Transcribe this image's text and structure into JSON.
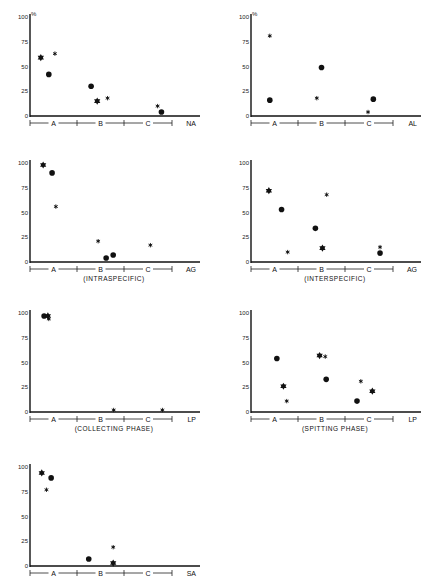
{
  "figure": {
    "y_unit_label": "%",
    "y_ticks": [
      "0",
      "25",
      "50",
      "75",
      "100"
    ],
    "x_groups": [
      "A",
      "B",
      "C"
    ],
    "marker_legend": {
      "star": "large six-pointed star",
      "asterisk": "small asterisk",
      "dot": "filled circle"
    }
  },
  "chart_data": [
    {
      "type": "scatter",
      "panel": "NA",
      "title": "",
      "caption": "",
      "ylabel": "%",
      "ylim": [
        0,
        100
      ],
      "categories": [
        "A",
        "B",
        "C"
      ],
      "show_pct": true,
      "points": [
        {
          "group": "A",
          "xpos": 0.23,
          "y": 59,
          "marker": "star"
        },
        {
          "group": "A",
          "xpos": 0.4,
          "y": 42,
          "marker": "dot"
        },
        {
          "group": "A",
          "xpos": 0.53,
          "y": 63,
          "marker": "asterisk"
        },
        {
          "group": "B",
          "xpos": 0.3,
          "y": 30,
          "marker": "dot"
        },
        {
          "group": "B",
          "xpos": 0.43,
          "y": 15,
          "marker": "star"
        },
        {
          "group": "B",
          "xpos": 0.65,
          "y": 18,
          "marker": "asterisk"
        },
        {
          "group": "C",
          "xpos": 0.7,
          "y": 10,
          "marker": "asterisk"
        },
        {
          "group": "C",
          "xpos": 0.78,
          "y": 4,
          "marker": "dot"
        }
      ]
    },
    {
      "type": "scatter",
      "panel": "AL",
      "title": "",
      "caption": "",
      "ylabel": "%",
      "ylim": [
        0,
        100
      ],
      "categories": [
        "A",
        "B",
        "C"
      ],
      "show_pct": true,
      "points": [
        {
          "group": "A",
          "xpos": 0.4,
          "y": 81,
          "marker": "asterisk"
        },
        {
          "group": "A",
          "xpos": 0.4,
          "y": 16,
          "marker": "dot"
        },
        {
          "group": "B",
          "xpos": 0.4,
          "y": 18,
          "marker": "asterisk"
        },
        {
          "group": "B",
          "xpos": 0.5,
          "y": 49,
          "marker": "dot"
        },
        {
          "group": "C",
          "xpos": 0.48,
          "y": 4,
          "marker": "asterisk"
        },
        {
          "group": "C",
          "xpos": 0.59,
          "y": 17,
          "marker": "dot"
        }
      ]
    },
    {
      "type": "scatter",
      "panel": "AG",
      "title": "",
      "caption": "(INTRASPECIFIC)",
      "ylabel": "",
      "ylim": [
        0,
        100
      ],
      "categories": [
        "A",
        "B",
        "C"
      ],
      "show_pct": false,
      "points": [
        {
          "group": "A",
          "xpos": 0.28,
          "y": 98,
          "marker": "star"
        },
        {
          "group": "A",
          "xpos": 0.47,
          "y": 90,
          "marker": "dot"
        },
        {
          "group": "A",
          "xpos": 0.55,
          "y": 56,
          "marker": "asterisk"
        },
        {
          "group": "B",
          "xpos": 0.45,
          "y": 21,
          "marker": "asterisk"
        },
        {
          "group": "B",
          "xpos": 0.62,
          "y": 4,
          "marker": "dot"
        },
        {
          "group": "B",
          "xpos": 0.77,
          "y": 7,
          "marker": "dot"
        },
        {
          "group": "C",
          "xpos": 0.55,
          "y": 17,
          "marker": "asterisk"
        }
      ]
    },
    {
      "type": "scatter",
      "panel": "AG",
      "title": "",
      "caption": "(INTERSPECIFIC)",
      "ylabel": "",
      "ylim": [
        0,
        100
      ],
      "categories": [
        "A",
        "B",
        "C"
      ],
      "show_pct": false,
      "points": [
        {
          "group": "A",
          "xpos": 0.38,
          "y": 72,
          "marker": "star"
        },
        {
          "group": "A",
          "xpos": 0.65,
          "y": 53,
          "marker": "dot"
        },
        {
          "group": "A",
          "xpos": 0.78,
          "y": 10,
          "marker": "asterisk"
        },
        {
          "group": "B",
          "xpos": 0.37,
          "y": 34,
          "marker": "dot"
        },
        {
          "group": "B",
          "xpos": 0.52,
          "y": 14,
          "marker": "star"
        },
        {
          "group": "B",
          "xpos": 0.61,
          "y": 68,
          "marker": "asterisk"
        },
        {
          "group": "C",
          "xpos": 0.73,
          "y": 15,
          "marker": "asterisk"
        },
        {
          "group": "C",
          "xpos": 0.73,
          "y": 9,
          "marker": "dot"
        }
      ]
    },
    {
      "type": "scatter",
      "panel": "LP",
      "title": "",
      "caption": "(COLLECTING PHASE)",
      "ylabel": "",
      "ylim": [
        0,
        100
      ],
      "categories": [
        "A",
        "B",
        "C"
      ],
      "show_pct": false,
      "points": [
        {
          "group": "A",
          "xpos": 0.3,
          "y": 97,
          "marker": "dot"
        },
        {
          "group": "A",
          "xpos": 0.38,
          "y": 97,
          "marker": "star"
        },
        {
          "group": "A",
          "xpos": 0.4,
          "y": 94,
          "marker": "asterisk"
        },
        {
          "group": "B",
          "xpos": 0.78,
          "y": 2,
          "marker": "asterisk"
        },
        {
          "group": "C",
          "xpos": 0.8,
          "y": 2,
          "marker": "asterisk"
        }
      ]
    },
    {
      "type": "scatter",
      "panel": "LP",
      "title": "",
      "caption": "(SPITTING PHASE)",
      "ylabel": "",
      "ylim": [
        0,
        100
      ],
      "categories": [
        "A",
        "B",
        "C"
      ],
      "show_pct": false,
      "points": [
        {
          "group": "A",
          "xpos": 0.55,
          "y": 54,
          "marker": "dot"
        },
        {
          "group": "A",
          "xpos": 0.69,
          "y": 26,
          "marker": "star"
        },
        {
          "group": "A",
          "xpos": 0.76,
          "y": 11,
          "marker": "asterisk"
        },
        {
          "group": "B",
          "xpos": 0.46,
          "y": 57,
          "marker": "star"
        },
        {
          "group": "B",
          "xpos": 0.58,
          "y": 56,
          "marker": "asterisk"
        },
        {
          "group": "B",
          "xpos": 0.6,
          "y": 33,
          "marker": "dot"
        },
        {
          "group": "C",
          "xpos": 0.25,
          "y": 11,
          "marker": "dot"
        },
        {
          "group": "C",
          "xpos": 0.33,
          "y": 31,
          "marker": "asterisk"
        },
        {
          "group": "C",
          "xpos": 0.57,
          "y": 21,
          "marker": "star"
        }
      ]
    },
    {
      "type": "scatter",
      "panel": "SA",
      "title": "",
      "caption": "",
      "ylabel": "",
      "ylim": [
        0,
        100
      ],
      "categories": [
        "A",
        "B",
        "C"
      ],
      "show_pct": false,
      "points": [
        {
          "group": "A",
          "xpos": 0.25,
          "y": 94,
          "marker": "star"
        },
        {
          "group": "A",
          "xpos": 0.45,
          "y": 89,
          "marker": "dot"
        },
        {
          "group": "A",
          "xpos": 0.35,
          "y": 77,
          "marker": "asterisk"
        },
        {
          "group": "B",
          "xpos": 0.25,
          "y": 7,
          "marker": "dot"
        },
        {
          "group": "B",
          "xpos": 0.77,
          "y": 19,
          "marker": "asterisk"
        },
        {
          "group": "B",
          "xpos": 0.77,
          "y": 3,
          "marker": "star"
        }
      ]
    }
  ]
}
